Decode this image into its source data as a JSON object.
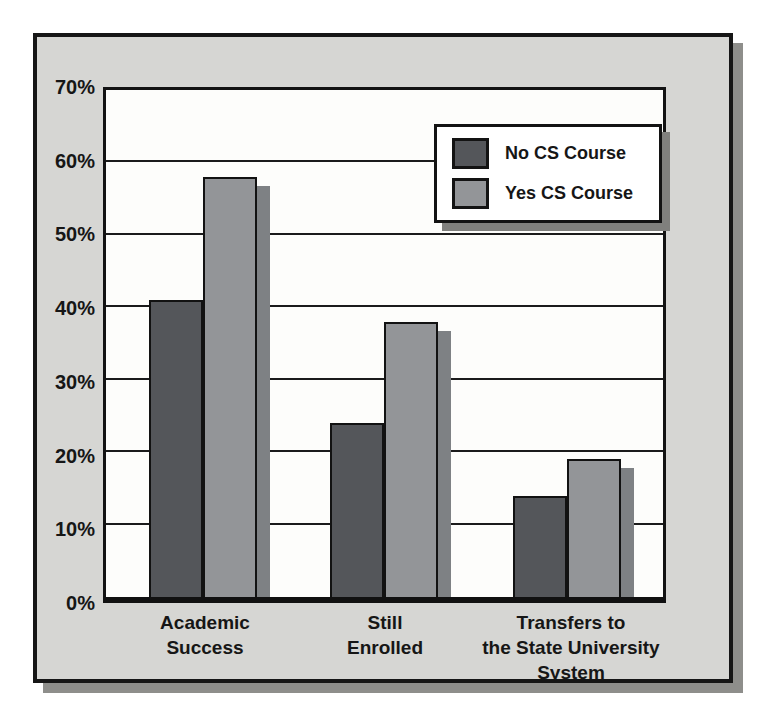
{
  "figure": {
    "kind": "scanned-bar-chart",
    "frame_background": "#d6d6d3",
    "frame_border_color": "#161616",
    "frame_shadow_color": "#8e8e8b",
    "plot_background": "#fdfdfb",
    "gridline_color": "#1b1b1b"
  },
  "legend": {
    "position": "top-right",
    "background": "#ffffff",
    "border_color": "#131313",
    "items": [
      {
        "label": "No CS Course",
        "color": "#54565a"
      },
      {
        "label": "Yes CS Course",
        "color": "#939598"
      }
    ]
  },
  "chart_data": {
    "type": "bar",
    "title": "",
    "xlabel": "",
    "ylabel": "",
    "categories": [
      "Academic Success",
      "Still Enrolled",
      "Transfers to the State University System"
    ],
    "category_lines": [
      [
        "Academic",
        "Success"
      ],
      [
        "Still",
        "Enrolled"
      ],
      [
        "Transfers to",
        "the State University",
        "System"
      ]
    ],
    "series": [
      {
        "name": "No CS Course",
        "color": "#54565a",
        "values": [
          41,
          24,
          14
        ]
      },
      {
        "name": "Yes CS Course",
        "color": "#939598",
        "values": [
          58,
          38,
          19
        ]
      }
    ],
    "y_ticks": [
      "0%",
      "10%",
      "20%",
      "30%",
      "40%",
      "50%",
      "60%",
      "70%"
    ],
    "ylim": [
      0,
      70
    ],
    "grid": "horizontal",
    "legend_position": "top-right",
    "bar_shadow_color": "#7e8184"
  }
}
